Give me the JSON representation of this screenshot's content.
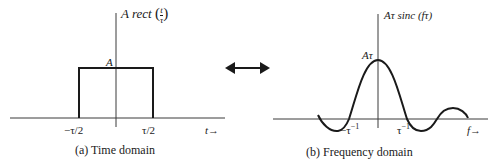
{
  "left_panel": {
    "function_label": "A rect",
    "function_arg_num": "t",
    "function_arg_den": "τ",
    "amplitude_label": "A",
    "tick_left": "−τ/2",
    "tick_right": "τ/2",
    "axis_label": "t→",
    "caption": "(a) Time domain"
  },
  "right_panel": {
    "function_label": "Aτ sinc (fτ)",
    "amplitude_label": "Aτ",
    "tick_left": "−τ",
    "tick_left_sup": "−1",
    "tick_right": "τ",
    "tick_right_sup": "−1",
    "axis_label": "f→",
    "caption": "(b) Frequency domain"
  },
  "connector": {
    "icon": "double-arrow-icon"
  },
  "colors": {
    "stroke": "#1a1a1a",
    "axis": "#3a3a3a",
    "background": "#ffffff"
  }
}
